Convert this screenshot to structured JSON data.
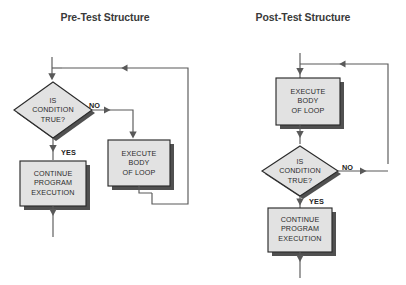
{
  "figure": {
    "background_color": "#ffffff",
    "line_color": "#595959",
    "node_fill": "#e2e2e2",
    "node_stroke": "#2b2b2b",
    "shadow_color": "#3d3d3d",
    "text_color": "#2b2b2b",
    "title_color": "#3a3a3a"
  },
  "charts": [
    {
      "id": "pre-test",
      "title": "Pre-Test Structure",
      "nodes": [
        {
          "id": "decision",
          "type": "diamond",
          "label": "IS\nCONDITION\nTRUE?"
        },
        {
          "id": "continue",
          "type": "process",
          "label": "CONTINUE\nPROGRAM\nEXECUTION"
        },
        {
          "id": "execute",
          "type": "process",
          "label": "EXECUTE\nBODY\nOF LOOP"
        }
      ],
      "edges": [
        {
          "from": "entry",
          "to": "decision",
          "label": ""
        },
        {
          "from": "decision",
          "to": "execute",
          "label": "NO"
        },
        {
          "from": "decision",
          "to": "continue",
          "label": "YES"
        },
        {
          "from": "execute",
          "to": "decision",
          "label": ""
        },
        {
          "from": "continue",
          "to": "exit",
          "label": ""
        }
      ]
    },
    {
      "id": "post-test",
      "title": "Post-Test Structure",
      "nodes": [
        {
          "id": "execute",
          "type": "process",
          "label": "EXECUTE\nBODY\nOF LOOP"
        },
        {
          "id": "decision",
          "type": "diamond",
          "label": "IS\nCONDITION\nTRUE?"
        },
        {
          "id": "continue",
          "type": "process",
          "label": "CONTINUE\nPROGRAM\nEXECUTION"
        }
      ],
      "edges": [
        {
          "from": "entry",
          "to": "execute",
          "label": ""
        },
        {
          "from": "execute",
          "to": "decision",
          "label": ""
        },
        {
          "from": "decision",
          "to": "execute",
          "label": "NO"
        },
        {
          "from": "decision",
          "to": "continue",
          "label": "YES"
        },
        {
          "from": "continue",
          "to": "exit",
          "label": ""
        }
      ]
    }
  ],
  "labels": {
    "yes": "YES",
    "no": "NO",
    "is_condition_true": "IS\nCONDITION\nTRUE?",
    "continue_program_execution": "CONTINUE\nPROGRAM\nEXECUTION",
    "execute_body_of_loop": "EXECUTE\nBODY\nOF LOOP"
  }
}
